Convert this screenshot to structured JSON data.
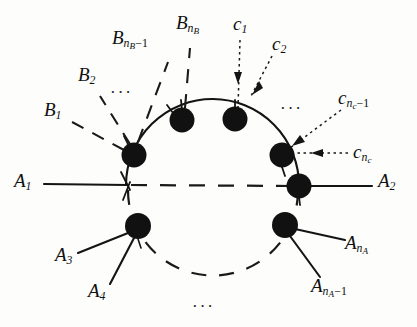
{
  "figure": {
    "background_color": "#fdfdfc",
    "ink_color": "#101010",
    "vertex_color": "#111111"
  },
  "labels": {
    "a1": {
      "base": "A",
      "sub": "1",
      "x": 14,
      "y": 180
    },
    "a2": {
      "base": "A",
      "sub": "2",
      "x": 378,
      "y": 180
    },
    "a3": {
      "base": "A",
      "sub": "3",
      "x": 55,
      "y": 252
    },
    "a4": {
      "base": "A",
      "sub": "4",
      "x": 88,
      "y": 288
    },
    "a_na": {
      "base": "A",
      "sub": "n",
      "subsub": "A",
      "x": 345,
      "y": 240
    },
    "a_na_minus_1": {
      "base": "A",
      "sub": "n",
      "subsub": "A",
      "op": "−1",
      "x": 316,
      "y": 283
    },
    "b1": {
      "base": "B",
      "sub": "1",
      "x": 44,
      "y": 108
    },
    "b2": {
      "base": "B",
      "sub": "2",
      "x": 78,
      "y": 72
    },
    "b_nb_minus_1": {
      "base": "B",
      "sub": "n",
      "subsub": "B",
      "op": "−1",
      "x": 115,
      "y": 35
    },
    "b_nb": {
      "base": "B",
      "sub": "n",
      "subsub": "B",
      "x": 176,
      "y": 20
    },
    "c1": {
      "base": "c",
      "sub": "1",
      "x": 233,
      "y": 18
    },
    "c2": {
      "base": "c",
      "sub": "2",
      "x": 272,
      "y": 38
    },
    "c_nc_minus_1": {
      "base": "c",
      "sub": "n",
      "subsub": "c",
      "op": "−1",
      "x": 342,
      "y": 95
    },
    "c_nc": {
      "base": "c",
      "sub": "n",
      "subsub": "c",
      "x": 355,
      "y": 147
    }
  },
  "ellipses": {
    "upper_left": {
      "text": "···",
      "x": 110,
      "y": 84
    },
    "upper_right": {
      "text": "···",
      "x": 280,
      "y": 100
    },
    "bottom": {
      "text": "···",
      "x": 192,
      "y": 298
    }
  },
  "geometry": {
    "circle": {
      "cx": 206,
      "cy": 185,
      "r": 78
    },
    "vertices": [
      {
        "name": "vertex-b1",
        "x": 134,
        "y": 155,
        "r": 12
      },
      {
        "name": "vertex-bnb-minus-1",
        "x": 182,
        "y": 120,
        "r": 12
      },
      {
        "name": "vertex-bnb",
        "x": 235,
        "y": 119,
        "r": 12
      },
      {
        "name": "vertex-cnc",
        "x": 282,
        "y": 155,
        "r": 12
      },
      {
        "name": "vertex-a2",
        "x": 299,
        "y": 186,
        "r": 12
      },
      {
        "name": "vertex-a3a4",
        "x": 138,
        "y": 226,
        "r": 13
      },
      {
        "name": "vertex-ana",
        "x": 285,
        "y": 225,
        "r": 13
      }
    ],
    "junction": {
      "x": 126,
      "y": 185
    }
  }
}
